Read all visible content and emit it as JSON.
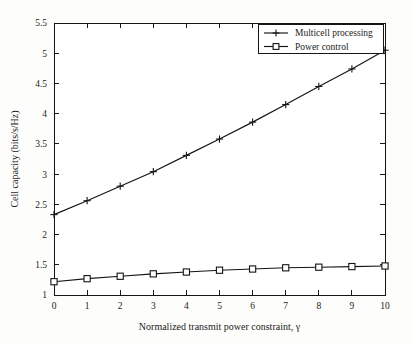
{
  "chart_data": {
    "type": "line",
    "title": "",
    "xlabel": "Normalized transmit power constraint, γ",
    "ylabel": "Cell capacity (bits/s/Hz)",
    "x": [
      0,
      1,
      2,
      3,
      4,
      5,
      6,
      7,
      8,
      9,
      10
    ],
    "xlim": [
      0,
      10
    ],
    "ylim": [
      1,
      5.5
    ],
    "xticks": [
      "0",
      "1",
      "2",
      "3",
      "4",
      "5",
      "6",
      "7",
      "8",
      "9",
      "10"
    ],
    "yticks": [
      "1",
      "1.5",
      "2",
      "2.5",
      "3",
      "3.5",
      "4",
      "4.5",
      "5",
      "5.5"
    ],
    "grid": false,
    "legend_position": "top-right",
    "series": [
      {
        "name": "Multicell processing",
        "marker": "plus",
        "color": "#141414",
        "values": [
          2.33,
          2.56,
          2.8,
          3.04,
          3.31,
          3.58,
          3.86,
          4.15,
          4.45,
          4.74,
          5.05
        ]
      },
      {
        "name": "Power control",
        "marker": "square",
        "color": "#141414",
        "values": [
          1.22,
          1.27,
          1.31,
          1.35,
          1.38,
          1.41,
          1.43,
          1.45,
          1.46,
          1.47,
          1.48
        ]
      }
    ]
  },
  "legend": {
    "entries": [
      {
        "label": "Multicell processing",
        "marker": "plus-marker"
      },
      {
        "label": "Power control",
        "marker": "square-marker"
      }
    ]
  },
  "colors": {
    "ink": "#141414",
    "page": "#fdfdfb",
    "plot_background": "#ffffff"
  }
}
